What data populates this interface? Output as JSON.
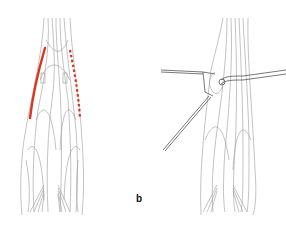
{
  "figure": {
    "panels": [
      {
        "id": "a",
        "label": "",
        "description": "forearm anatomy with incision markings"
      },
      {
        "id": "b",
        "label": "b",
        "description": "forearm anatomy with retractors"
      }
    ],
    "colors": {
      "incision": "#d9361c",
      "line": "#8a8a8a",
      "background": "#ffffff"
    }
  }
}
